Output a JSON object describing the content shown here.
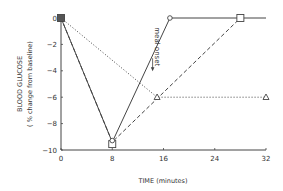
{
  "chart_data": {
    "type": "line",
    "title": "",
    "xlabel": "TIME (minutes)",
    "ylabel": "BLOOD GLUCOSE",
    "ylabel_sub": "( % change from baseline)",
    "xlim": [
      0,
      32
    ],
    "ylim": [
      -10,
      0
    ],
    "xticks": [
      0,
      8,
      16,
      24,
      32
    ],
    "yticks": [
      0,
      -2,
      -4,
      -6,
      -8,
      -10
    ],
    "grid": false,
    "legend": "none",
    "series": [
      {
        "name": "solid-circle",
        "style": "solid",
        "marker": "circle",
        "x": [
          0,
          8,
          17,
          32
        ],
        "y": [
          0,
          -9.4,
          0,
          0
        ]
      },
      {
        "name": "dashed-square",
        "style": "dashed",
        "marker": "square",
        "x": [
          0,
          8,
          28
        ],
        "y": [
          0,
          -9.4,
          0
        ]
      },
      {
        "name": "dotted-triangle",
        "style": "dotted",
        "marker": "triangle",
        "x": [
          0,
          15,
          32
        ],
        "y": [
          0,
          -6,
          -6
        ]
      }
    ],
    "annotations": [
      {
        "text": "meal onset",
        "x": 14.3,
        "y": -3.2,
        "arrow": "down",
        "rotation": 90
      }
    ]
  }
}
